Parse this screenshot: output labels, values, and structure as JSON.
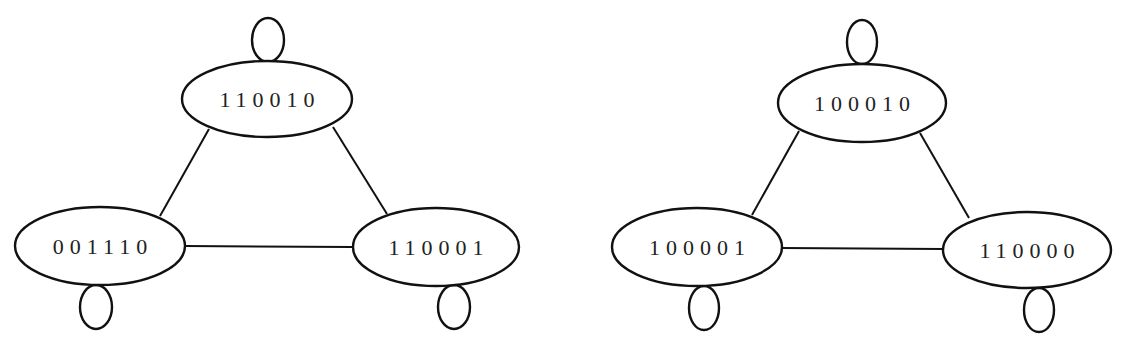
{
  "diagram": {
    "type": "state-graph",
    "background": "#ffffff",
    "stroke_color": "#111111",
    "graphs": [
      {
        "name": "left-graph",
        "nodes": [
          {
            "id": "top",
            "label": "110010",
            "cx": 267,
            "cy": 99,
            "rx": 85,
            "ry": 38,
            "loop": {
              "cx": 268,
              "cy": 40,
              "rx": 16,
              "ry": 22,
              "side": "top"
            }
          },
          {
            "id": "bottom-left",
            "label": "001110",
            "cx": 100,
            "cy": 246,
            "rx": 85,
            "ry": 39,
            "loop": {
              "cx": 96,
              "cy": 307,
              "rx": 16,
              "ry": 22,
              "side": "bottom"
            }
          },
          {
            "id": "bottom-right",
            "label": "110001",
            "cx": 436,
            "cy": 247,
            "rx": 83,
            "ry": 39,
            "loop": {
              "cx": 454,
              "cy": 307,
              "rx": 16,
              "ry": 22,
              "side": "bottom"
            }
          }
        ],
        "edges": [
          {
            "from": "top",
            "to": "bottom-left",
            "x1": 209,
            "y1": 129,
            "x2": 160,
            "y2": 216
          },
          {
            "from": "top",
            "to": "bottom-right",
            "x1": 333,
            "y1": 127,
            "x2": 387,
            "y2": 214
          },
          {
            "from": "bottom-left",
            "to": "bottom-right",
            "x1": 185,
            "y1": 246,
            "x2": 353,
            "y2": 247
          }
        ]
      },
      {
        "name": "right-graph",
        "nodes": [
          {
            "id": "top",
            "label": "100010",
            "cx": 862,
            "cy": 103,
            "rx": 84,
            "ry": 39,
            "loop": {
              "cx": 862,
              "cy": 42,
              "rx": 15,
              "ry": 22,
              "side": "top"
            }
          },
          {
            "id": "bottom-left",
            "label": "100001",
            "cx": 697,
            "cy": 247,
            "rx": 85,
            "ry": 39,
            "loop": {
              "cx": 704,
              "cy": 308,
              "rx": 15,
              "ry": 22,
              "side": "bottom"
            }
          },
          {
            "id": "bottom-right",
            "label": "110000",
            "cx": 1027,
            "cy": 250,
            "rx": 84,
            "ry": 38,
            "loop": {
              "cx": 1039,
              "cy": 310,
              "rx": 15,
              "ry": 22,
              "side": "bottom"
            }
          }
        ],
        "edges": [
          {
            "from": "top",
            "to": "bottom-left",
            "x1": 799,
            "y1": 131,
            "x2": 752,
            "y2": 215
          },
          {
            "from": "top",
            "to": "bottom-right",
            "x1": 920,
            "y1": 133,
            "x2": 969,
            "y2": 218
          },
          {
            "from": "bottom-left",
            "to": "bottom-right",
            "x1": 782,
            "y1": 248,
            "x2": 943,
            "y2": 249
          }
        ]
      }
    ]
  }
}
